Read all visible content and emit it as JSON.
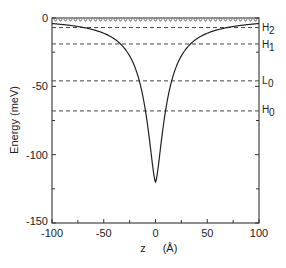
{
  "chart_data": {
    "type": "line",
    "title": "",
    "xlabel": "z (Å)",
    "ylabel": "Energy (meV)",
    "xlim": [
      -100,
      100
    ],
    "ylim": [
      -150,
      0
    ],
    "xticks": [
      -100,
      -50,
      0,
      50,
      100
    ],
    "yticks": [
      0,
      -50,
      -100,
      -150
    ],
    "grid": false,
    "series": [
      {
        "name": "potential",
        "style": "solid",
        "x": [
          -100,
          -80,
          -60,
          -40,
          -30,
          -20,
          -15,
          -10,
          -5,
          0,
          5,
          10,
          15,
          20,
          30,
          40,
          60,
          80,
          100
        ],
        "y": [
          -7,
          -9,
          -12,
          -18,
          -25,
          -40,
          -55,
          -75,
          -100,
          -120,
          -100,
          -75,
          -55,
          -40,
          -25,
          -18,
          -12,
          -9,
          -7
        ]
      }
    ],
    "levels": [
      {
        "name": "top",
        "label": "",
        "value": -2,
        "style": "wavy-dashed"
      },
      {
        "name": "H2",
        "label": "H2",
        "value": -7,
        "style": "dashed"
      },
      {
        "name": "H1",
        "label": "H1",
        "value": -19,
        "style": "dashed"
      },
      {
        "name": "L0",
        "label": "L0",
        "value": -46,
        "style": "dashed"
      },
      {
        "name": "H0",
        "label": "H0",
        "value": -68,
        "style": "dashed"
      }
    ]
  },
  "labels": {
    "ylabel": "Energy   (meV)",
    "xlabel_z": "z",
    "xlabel_unit": "(Å)",
    "level_H2_main": "H",
    "level_H2_sub": "2",
    "level_H1_main": "H",
    "level_H1_sub": "1",
    "level_L0_main": "L",
    "level_L0_sub": "0",
    "level_H0_main": "H",
    "level_H0_sub": "0"
  }
}
